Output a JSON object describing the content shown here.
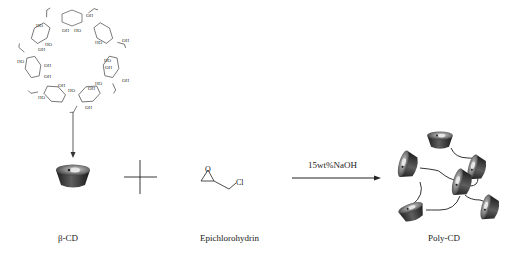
{
  "scheme": {
    "reactants": [
      {
        "name": "beta-cyclodextrin",
        "label": "β-CD"
      },
      {
        "name": "epichlorohydrin",
        "label": "Epichlorohydrin",
        "substituent": "Cl",
        "ring_atom": "O"
      }
    ],
    "operator": "+",
    "condition": "15wt%NaOH",
    "product": {
      "name": "poly-cyclodextrin",
      "label": "Poly-CD"
    },
    "ring_groups": {
      "hydroxyl": "OH",
      "hydroxyl_left": "HO",
      "ring_oxygen": "O"
    }
  },
  "colors": {
    "line": "#222222",
    "cone_dark": "#2e2e2e",
    "cone_mid": "#6a6a6a",
    "cone_light": "#c8c8c8"
  }
}
